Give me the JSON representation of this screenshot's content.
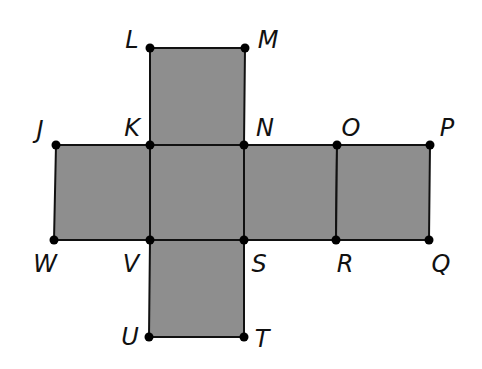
{
  "diagram": {
    "type": "cube net",
    "fill_color": "#8e8e8e",
    "stroke_color": "#111111",
    "vertices": {
      "L": {
        "label": "L",
        "x": 150,
        "y": 48,
        "lx": 132,
        "ly": 40
      },
      "M": {
        "label": "M",
        "x": 245,
        "y": 48,
        "lx": 268,
        "ly": 40
      },
      "J": {
        "label": "J",
        "x": 56,
        "y": 145,
        "lx": 40,
        "ly": 130
      },
      "K": {
        "label": "K",
        "x": 150,
        "y": 145,
        "lx": 132,
        "ly": 128
      },
      "N": {
        "label": "N",
        "x": 244,
        "y": 145,
        "lx": 265,
        "ly": 128
      },
      "O": {
        "label": "O",
        "x": 337,
        "y": 145,
        "lx": 351,
        "ly": 128
      },
      "P": {
        "label": "P",
        "x": 430,
        "y": 145,
        "lx": 447,
        "ly": 128
      },
      "W": {
        "label": "W",
        "x": 54,
        "y": 240,
        "lx": 45,
        "ly": 264
      },
      "V": {
        "label": "V",
        "x": 150,
        "y": 240,
        "lx": 131,
        "ly": 264
      },
      "S": {
        "label": "S",
        "x": 244,
        "y": 240,
        "lx": 259,
        "ly": 264
      },
      "R": {
        "label": "R",
        "x": 336,
        "y": 240,
        "lx": 345,
        "ly": 264
      },
      "Q": {
        "label": "Q",
        "x": 429,
        "y": 240,
        "lx": 441,
        "ly": 264
      },
      "U": {
        "label": "U",
        "x": 149,
        "y": 337,
        "lx": 130,
        "ly": 337
      },
      "T": {
        "label": "T",
        "x": 244,
        "y": 337,
        "lx": 262,
        "ly": 339
      }
    },
    "faces": [
      [
        "L",
        "M",
        "N",
        "K"
      ],
      [
        "J",
        "K",
        "V",
        "W"
      ],
      [
        "K",
        "N",
        "S",
        "V"
      ],
      [
        "N",
        "O",
        "R",
        "S"
      ],
      [
        "O",
        "P",
        "Q",
        "R"
      ],
      [
        "V",
        "S",
        "T",
        "U"
      ]
    ]
  }
}
